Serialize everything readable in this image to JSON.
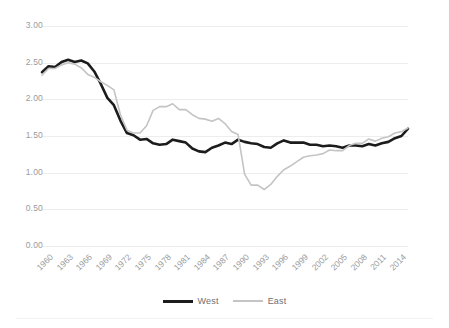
{
  "chart": {
    "title": "",
    "subtitle": ""
  },
  "axes": {
    "y_ticks": [
      "3.00",
      "2.50",
      "2.00",
      "1.50",
      "1.00",
      "0.50",
      "0.00"
    ],
    "x_ticks": [
      "1960",
      "1963",
      "1966",
      "1969",
      "1972",
      "1975",
      "1978",
      "1981",
      "1984",
      "1987",
      "1990",
      "1993",
      "1996",
      "1999",
      "2002",
      "2005",
      "2008",
      "2011",
      "2014"
    ]
  },
  "legend": {
    "items": [
      {
        "label": "West",
        "color": "#1c1c1c"
      },
      {
        "label": "East",
        "color": "#c4c4c4"
      }
    ]
  },
  "chart_data": {
    "type": "line",
    "title": "",
    "xlabel": "",
    "ylabel": "",
    "ylim": [
      0.0,
      3.0
    ],
    "ytick_values": [
      3.0,
      2.5,
      2.0,
      1.5,
      1.0,
      0.5,
      0.0
    ],
    "xlim": [
      1960,
      2016
    ],
    "xtick_values": [
      1960,
      1963,
      1966,
      1969,
      1972,
      1975,
      1978,
      1981,
      1984,
      1987,
      1990,
      1993,
      1996,
      1999,
      2002,
      2005,
      2008,
      2011,
      2014
    ],
    "grid": "horizontal",
    "legend_position": "bottom",
    "x": [
      1960,
      1961,
      1962,
      1963,
      1964,
      1965,
      1966,
      1967,
      1968,
      1969,
      1970,
      1971,
      1972,
      1973,
      1974,
      1975,
      1976,
      1977,
      1978,
      1979,
      1980,
      1981,
      1982,
      1983,
      1984,
      1985,
      1986,
      1987,
      1988,
      1989,
      1990,
      1991,
      1992,
      1993,
      1994,
      1995,
      1996,
      1997,
      1998,
      1999,
      2000,
      2001,
      2002,
      2003,
      2004,
      2005,
      2006,
      2007,
      2008,
      2009,
      2010,
      2011,
      2012,
      2013,
      2014,
      2015,
      2016
    ],
    "series": [
      {
        "name": "West",
        "color": "#1c1c1c",
        "line_width": 2.6,
        "values": [
          2.37,
          2.45,
          2.44,
          2.51,
          2.54,
          2.51,
          2.53,
          2.49,
          2.38,
          2.21,
          2.02,
          1.92,
          1.71,
          1.54,
          1.51,
          1.45,
          1.46,
          1.4,
          1.38,
          1.39,
          1.45,
          1.43,
          1.41,
          1.33,
          1.29,
          1.28,
          1.34,
          1.37,
          1.41,
          1.39,
          1.45,
          1.42,
          1.4,
          1.39,
          1.35,
          1.34,
          1.4,
          1.44,
          1.41,
          1.41,
          1.41,
          1.38,
          1.38,
          1.36,
          1.37,
          1.36,
          1.34,
          1.37,
          1.37,
          1.36,
          1.39,
          1.37,
          1.4,
          1.42,
          1.47,
          1.5,
          1.6
        ]
      },
      {
        "name": "East",
        "color": "#c4c4c4",
        "line_width": 1.6,
        "values": [
          2.33,
          2.42,
          2.42,
          2.47,
          2.5,
          2.48,
          2.43,
          2.34,
          2.3,
          2.24,
          2.19,
          2.13,
          1.79,
          1.58,
          1.54,
          1.54,
          1.64,
          1.85,
          1.9,
          1.9,
          1.94,
          1.86,
          1.86,
          1.79,
          1.74,
          1.73,
          1.7,
          1.74,
          1.67,
          1.56,
          1.52,
          0.98,
          0.83,
          0.83,
          0.77,
          0.84,
          0.95,
          1.04,
          1.09,
          1.15,
          1.21,
          1.23,
          1.24,
          1.26,
          1.31,
          1.3,
          1.3,
          1.37,
          1.4,
          1.4,
          1.46,
          1.43,
          1.47,
          1.49,
          1.54,
          1.56,
          1.61
        ]
      }
    ]
  }
}
